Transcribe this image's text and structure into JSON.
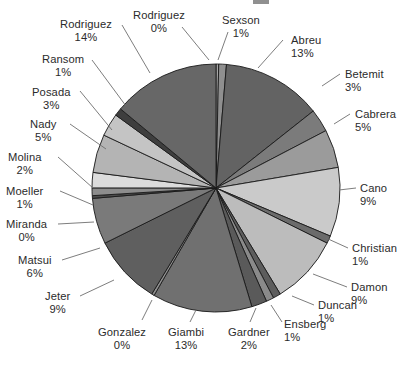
{
  "chart": {
    "type": "pie",
    "center_x": 216,
    "center_y": 188,
    "radius": 124,
    "start_angle_deg": -90,
    "direction": "clockwise"
  },
  "chart_data": {
    "type": "pie",
    "title": "",
    "subtitle": "",
    "xlabel": "",
    "ylabel": "",
    "legend_position": "none",
    "grid": false,
    "label_format": "name + percent",
    "categories": [
      "Rodriguez",
      "Sexson",
      "Abreu",
      "Betemit",
      "Cabrera",
      "Cano",
      "Christian",
      "Damon",
      "Duncan",
      "Ensberg",
      "Gardner",
      "Giambi",
      "Gonzalez",
      "Jeter",
      "Matsui",
      "Miranda",
      "Moeller",
      "Molina",
      "Nady",
      "Posada",
      "Ransom",
      "Rodriguez"
    ],
    "values": [
      0,
      1,
      13,
      3,
      5,
      9,
      1,
      9,
      1,
      1,
      2,
      13,
      0,
      9,
      6,
      0,
      1,
      2,
      5,
      3,
      1,
      14
    ],
    "units": "%",
    "slices": [
      {
        "name": "Rodriguez",
        "percent": 0,
        "label": "Rodriguez",
        "value_label": "0%",
        "color": "#a8a8a8"
      },
      {
        "name": "Sexson",
        "percent": 1,
        "label": "Sexson",
        "value_label": "1%",
        "color": "#8f8f8f"
      },
      {
        "name": "Abreu",
        "percent": 13,
        "label": "Abreu",
        "value_label": "13%",
        "color": "#636363"
      },
      {
        "name": "Betemit",
        "percent": 3,
        "label": "Betemit",
        "value_label": "3%",
        "color": "#7b7b7b"
      },
      {
        "name": "Cabrera",
        "percent": 5,
        "label": "Cabrera",
        "value_label": "5%",
        "color": "#9b9b9b"
      },
      {
        "name": "Cano",
        "percent": 9,
        "label": "Cano",
        "value_label": "9%",
        "color": "#cacaca"
      },
      {
        "name": "Christian",
        "percent": 1,
        "label": "Christian",
        "value_label": "1%",
        "color": "#6b6b6b"
      },
      {
        "name": "Damon",
        "percent": 9,
        "label": "Damon",
        "value_label": "9%",
        "color": "#bcbcbc"
      },
      {
        "name": "Duncan",
        "percent": 1,
        "label": "Duncan",
        "value_label": "1%",
        "color": "#5d5d5d"
      },
      {
        "name": "Ensberg",
        "percent": 1,
        "label": "Ensberg",
        "value_label": "1%",
        "color": "#8a8a8a"
      },
      {
        "name": "Gardner",
        "percent": 2,
        "label": "Gardner",
        "value_label": "2%",
        "color": "#5a5a5a"
      },
      {
        "name": "Giambi",
        "percent": 13,
        "label": "Giambi",
        "value_label": "13%",
        "color": "#707070"
      },
      {
        "name": "Gonzalez",
        "percent": 0,
        "label": "Gonzalez",
        "value_label": "0%",
        "color": "#909090"
      },
      {
        "name": "Jeter",
        "percent": 9,
        "label": "Jeter",
        "value_label": "9%",
        "color": "#5f5f5f"
      },
      {
        "name": "Matsui",
        "percent": 6,
        "label": "Matsui",
        "value_label": "6%",
        "color": "#7a7a7a"
      },
      {
        "name": "Miranda",
        "percent": 0,
        "label": "Miranda",
        "value_label": "0%",
        "color": "#4d4d4d"
      },
      {
        "name": "Moeller",
        "percent": 1,
        "label": "Moeller",
        "value_label": "1%",
        "color": "#8d8d8d"
      },
      {
        "name": "Molina",
        "percent": 2,
        "label": "Molina",
        "value_label": "2%",
        "color": "#dcdcdc"
      },
      {
        "name": "Nady",
        "percent": 5,
        "label": "Nady",
        "value_label": "5%",
        "color": "#b4b4b4"
      },
      {
        "name": "Posada",
        "percent": 3,
        "label": "Posada",
        "value_label": "3%",
        "color": "#c4c4c4"
      },
      {
        "name": "Ransom",
        "percent": 1,
        "label": "Ransom",
        "value_label": "1%",
        "color": "#3e3e3e"
      },
      {
        "name": "Rodriguez",
        "percent": 14,
        "label": "Rodriguez",
        "value_label": "14%",
        "color": "#676767"
      }
    ]
  },
  "labels": [
    {
      "key": "rodriguez-0",
      "name": "Rodriguez",
      "pct": "0%",
      "x": 133,
      "y": 9,
      "align": "al-c",
      "leader": [
        182,
        27,
        209,
        60
      ]
    },
    {
      "key": "sexson",
      "name": "Sexson",
      "pct": "1%",
      "x": 222,
      "y": 14,
      "align": "al-c",
      "leader": [
        228,
        32,
        218,
        60
      ]
    },
    {
      "key": "abreu",
      "name": "Abreu",
      "pct": "13%",
      "x": 291,
      "y": 34,
      "align": "al-l",
      "leader": [
        283,
        40,
        258,
        68
      ]
    },
    {
      "key": "betemit",
      "name": "Betemit",
      "pct": "3%",
      "x": 345,
      "y": 68,
      "align": "al-l",
      "leader": [
        340,
        74,
        322,
        86
      ]
    },
    {
      "key": "cabrera",
      "name": "Cabrera",
      "pct": "5%",
      "x": 355,
      "y": 108,
      "align": "al-l",
      "leader": [
        350,
        114,
        334,
        124
      ]
    },
    {
      "key": "cano",
      "name": "Cano",
      "pct": "9%",
      "x": 360,
      "y": 182,
      "align": "al-l",
      "leader": [
        356,
        188,
        339,
        190
      ]
    },
    {
      "key": "christian",
      "name": "Christian",
      "pct": "1%",
      "x": 352,
      "y": 242,
      "align": "al-l",
      "leader": [
        348,
        248,
        326,
        238
      ]
    },
    {
      "key": "damon",
      "name": "Damon",
      "pct": "9%",
      "x": 351,
      "y": 281,
      "align": "al-l",
      "leader": [
        347,
        287,
        313,
        274
      ]
    },
    {
      "key": "duncan",
      "name": "Duncan",
      "pct": "1%",
      "x": 318,
      "y": 299,
      "align": "al-l",
      "leader": [
        314,
        305,
        292,
        296
      ]
    },
    {
      "key": "ensberg",
      "name": "Ensberg",
      "pct": "1%",
      "x": 284,
      "y": 318,
      "align": "al-l",
      "leader": [
        282,
        322,
        271,
        305
      ]
    },
    {
      "key": "gardner",
      "name": "Gardner",
      "pct": "2%",
      "x": 228,
      "y": 326,
      "align": "al-c",
      "leader": [
        250,
        322,
        256,
        308
      ]
    },
    {
      "key": "giambi",
      "name": "Giambi",
      "pct": "13%",
      "x": 168,
      "y": 326,
      "align": "al-c",
      "leader": [
        190,
        322,
        196,
        310
      ]
    },
    {
      "key": "gonzalez",
      "name": "Gonzalez",
      "pct": "0%",
      "x": 98,
      "y": 326,
      "align": "al-c",
      "leader": [
        142,
        320,
        152,
        300
      ]
    },
    {
      "key": "jeter",
      "name": "Jeter",
      "pct": "9%",
      "x": 45,
      "y": 290,
      "align": "al-c",
      "leader": [
        80,
        296,
        114,
        280
      ]
    },
    {
      "key": "matsui",
      "name": "Matsui",
      "pct": "6%",
      "x": 18,
      "y": 254,
      "align": "al-c",
      "leader": [
        62,
        260,
        100,
        248
      ]
    },
    {
      "key": "miranda",
      "name": "Miranda",
      "pct": "0%",
      "x": 6,
      "y": 218,
      "align": "al-c",
      "leader": [
        58,
        224,
        94,
        222
      ]
    },
    {
      "key": "moeller",
      "name": "Moeller",
      "pct": "1%",
      "x": 6,
      "y": 185,
      "align": "al-c",
      "leader": [
        60,
        191,
        93,
        205
      ]
    },
    {
      "key": "molina",
      "name": "Molina",
      "pct": "2%",
      "x": 8,
      "y": 151,
      "align": "al-c",
      "leader": [
        58,
        157,
        93,
        188
      ]
    },
    {
      "key": "nady",
      "name": "Nady",
      "pct": "5%",
      "x": 30,
      "y": 118,
      "align": "al-c",
      "leader": [
        70,
        124,
        106,
        149
      ]
    },
    {
      "key": "posada",
      "name": "Posada",
      "pct": "3%",
      "x": 32,
      "y": 86,
      "align": "al-c",
      "leader": [
        80,
        91,
        112,
        130
      ]
    },
    {
      "key": "ransom",
      "name": "Ransom",
      "pct": "1%",
      "x": 42,
      "y": 53,
      "align": "al-c",
      "leader": [
        92,
        60,
        126,
        106
      ]
    },
    {
      "key": "rodriguez-14",
      "name": "Rodriguez",
      "pct": "14%",
      "x": 60,
      "y": 18,
      "align": "al-c",
      "leader": [
        122,
        25,
        150,
        73
      ]
    }
  ]
}
